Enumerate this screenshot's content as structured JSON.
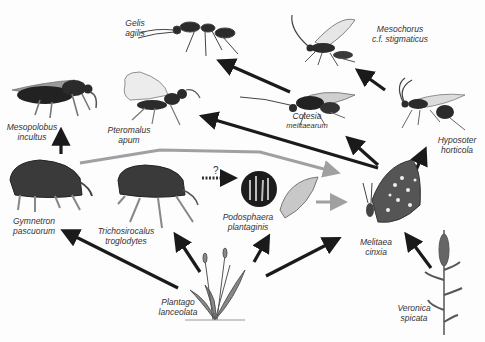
{
  "diagram": {
    "type": "food-web",
    "colors": {
      "trophic_arrow": "#1a1a1a",
      "grey_arrow": "#a0a0a0",
      "organism_dark": "#2b2b2b",
      "organism_mid": "#6a6a6a",
      "label": "#333333"
    },
    "question_mark": "?",
    "species": {
      "gelis": {
        "line1": "Gelis",
        "line2": "agilis"
      },
      "mesochorus": {
        "line1": "Mesochorus",
        "line2": "c.f. stigmaticus"
      },
      "mesopolobus": {
        "line1": "Mesopolobus",
        "line2": "incultus"
      },
      "pteromalus": {
        "line1": "Pteromalus",
        "line2": "apum"
      },
      "cotesia": {
        "line1": "Cotesia",
        "line2": "melitaearum"
      },
      "hyposoter": {
        "line1": "Hyposoter",
        "line2": "horticola"
      },
      "gymnetron": {
        "line1": "Gymnetron",
        "line2": "pascuorum"
      },
      "trichosirocalus": {
        "line1": "Trichosirocalus",
        "line2": "troglodytes"
      },
      "podosphaera": {
        "line1": "Podosphaera",
        "line2": "plantaginis"
      },
      "melitaea": {
        "line1": "Melitaea",
        "line2": "cinxia"
      },
      "plantago": {
        "line1": "Plantago",
        "line2": "lanceolata"
      },
      "veronica": {
        "line1": "Veronica",
        "line2": "spicata"
      }
    },
    "links": [
      {
        "from": "Plantago lanceolata",
        "to": "Gymnetron pascuorum",
        "style": "black"
      },
      {
        "from": "Plantago lanceolata",
        "to": "Trichosirocalus troglodytes",
        "style": "black"
      },
      {
        "from": "Plantago lanceolata",
        "to": "Podosphaera plantaginis",
        "style": "black"
      },
      {
        "from": "Plantago lanceolata",
        "to": "Melitaea cinxia",
        "style": "black"
      },
      {
        "from": "Veronica spicata",
        "to": "Melitaea cinxia",
        "style": "black"
      },
      {
        "from": "Gymnetron pascuorum",
        "to": "Mesopolobus incultus",
        "style": "black"
      },
      {
        "from": "Trichosirocalus troglodytes",
        "to": "Podosphaera plantaginis",
        "style": "dotted",
        "label": "?"
      },
      {
        "from": "Gymnetron pascuorum",
        "to": "Melitaea cinxia",
        "style": "grey"
      },
      {
        "from": "Podosphaera plantaginis",
        "to": "Melitaea cinxia",
        "style": "grey"
      },
      {
        "from": "Melitaea cinxia",
        "to": "Pteromalus apum",
        "style": "black"
      },
      {
        "from": "Melitaea cinxia",
        "to": "Cotesia melitaearum",
        "style": "black"
      },
      {
        "from": "Melitaea cinxia",
        "to": "Hyposoter horticola",
        "style": "black"
      },
      {
        "from": "Cotesia melitaearum",
        "to": "Gelis agilis",
        "style": "black"
      },
      {
        "from": "Hyposoter horticola",
        "to": "Mesochorus c.f. stigmaticus",
        "style": "black"
      }
    ]
  }
}
